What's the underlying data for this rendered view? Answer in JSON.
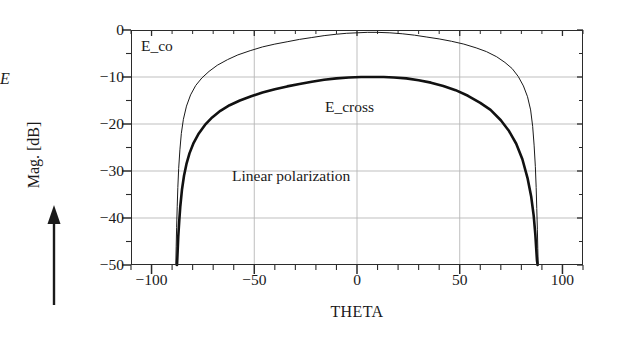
{
  "chart_data": {
    "type": "line",
    "title": "",
    "xlabel": "THETA",
    "ylabel": "Mag. [dB]",
    "xlim": [
      -110,
      110
    ],
    "ylim": [
      -50,
      0
    ],
    "grid": true,
    "grid_x_values": [
      -50,
      0,
      50
    ],
    "grid_y_values": [
      0,
      -10,
      -20,
      -30,
      -40,
      -50
    ],
    "x_major_ticks": [
      -100,
      -50,
      0,
      50,
      100
    ],
    "x_minor_tick_step": 10,
    "x_tick_labels": [
      "-100",
      "-50",
      "0",
      "50",
      "100"
    ],
    "y_major_ticks": [
      0,
      -10,
      -20,
      -30,
      -40,
      -50
    ],
    "y_minor_tick_step": 5,
    "y_tick_labels": [
      "0",
      "-10",
      "-20",
      "-30",
      "-40",
      "-50"
    ],
    "legend_position": "in-plot annotations",
    "series": [
      {
        "name": "E_co",
        "style": "thin",
        "line_width": 1.0,
        "color": "#1a1a1a",
        "x": [
          -88.2,
          -88.0,
          -87.8,
          -87.5,
          -87.2,
          -86.8,
          -86.2,
          -85.5,
          -84.5,
          -83.0,
          -81.0,
          -78.5,
          -75.5,
          -72.0,
          -68.0,
          -63.0,
          -58.0,
          -52.0,
          -46.0,
          -40.0,
          -34.0,
          -28.0,
          -22.0,
          -16.0,
          -10.0,
          -5.0,
          0.0,
          5.0,
          10.0,
          16.0,
          22.0,
          28.0,
          34.0,
          40.0,
          46.0,
          52.0,
          58.0,
          63.0,
          68.0,
          72.0,
          75.5,
          78.5,
          81.0,
          83.0,
          84.5,
          85.5,
          86.2,
          86.8,
          87.2,
          87.5,
          87.8,
          88.0,
          88.2
        ],
        "y": [
          -50.0,
          -46.0,
          -42.0,
          -37.5,
          -33.5,
          -29.5,
          -25.5,
          -22.0,
          -19.0,
          -16.2,
          -13.8,
          -11.8,
          -10.2,
          -8.8,
          -7.5,
          -6.3,
          -5.3,
          -4.4,
          -3.6,
          -3.0,
          -2.5,
          -2.0,
          -1.6,
          -1.2,
          -0.9,
          -0.7,
          -0.6,
          -0.5,
          -0.5,
          -0.6,
          -0.8,
          -1.1,
          -1.5,
          -1.9,
          -2.4,
          -3.0,
          -3.8,
          -4.6,
          -5.7,
          -6.9,
          -8.2,
          -9.9,
          -11.9,
          -14.2,
          -17.0,
          -20.5,
          -24.5,
          -29.0,
          -33.5,
          -38.0,
          -42.5,
          -46.5,
          -50.0
        ]
      },
      {
        "name": "E_cross",
        "style": "thick",
        "line_width": 2.6,
        "color": "#111111",
        "x": [
          -87.6,
          -87.3,
          -87.0,
          -86.5,
          -86.0,
          -85.2,
          -84.2,
          -83.0,
          -81.5,
          -79.5,
          -77.0,
          -74.0,
          -70.5,
          -66.5,
          -62.0,
          -57.0,
          -51.5,
          -46.0,
          -40.0,
          -34.0,
          -28.0,
          -22.0,
          -16.0,
          -10.0,
          -4.0,
          2.0,
          8.0,
          13.0,
          18.0,
          24.0,
          30.0,
          36.0,
          42.0,
          48.0,
          54.0,
          60.0,
          65.0,
          70.0,
          74.0,
          77.5,
          80.5,
          83.0,
          84.8,
          86.0,
          86.8,
          87.3,
          87.6,
          87.9
        ],
        "y": [
          -50.0,
          -47.0,
          -44.0,
          -40.5,
          -37.5,
          -34.0,
          -31.0,
          -28.5,
          -26.2,
          -24.0,
          -22.0,
          -20.2,
          -18.6,
          -17.2,
          -16.0,
          -15.0,
          -14.1,
          -13.3,
          -12.6,
          -12.0,
          -11.5,
          -11.0,
          -10.6,
          -10.3,
          -10.1,
          -10.0,
          -10.0,
          -10.0,
          -10.1,
          -10.3,
          -10.7,
          -11.2,
          -11.9,
          -12.8,
          -14.0,
          -15.5,
          -17.0,
          -19.2,
          -21.5,
          -24.2,
          -27.5,
          -31.5,
          -35.5,
          -39.5,
          -43.5,
          -47.0,
          -49.0,
          -50.0
        ]
      }
    ],
    "annotations": [
      {
        "id": "e_co",
        "text": "E_co",
        "x": -83,
        "y": -2.5
      },
      {
        "id": "e_cross",
        "text": "E_cross",
        "x": -2,
        "y": -15.5
      },
      {
        "id": "linear_polarization",
        "text": "Linear polarization",
        "x": -24,
        "y": -30.5
      }
    ]
  },
  "axes": {
    "y_title": "Mag. [dB]",
    "x_title": "THETA",
    "y_tick_labels": [
      "0",
      "−10",
      "−20",
      "−30",
      "−40",
      "−50"
    ],
    "x_tick_labels": [
      "−100",
      "−50",
      "0",
      "50",
      "100"
    ]
  },
  "annotations": {
    "e_co": "E_co",
    "e_cross": "E_cross",
    "linear_polarization": "Linear polarization",
    "field_arrow_label": "E"
  },
  "colors": {
    "axis": "#2b2b2b",
    "grid": "#b8b8b8",
    "curve_thin": "#1a1a1a",
    "curve_thick": "#111111",
    "background": "#ffffff"
  }
}
